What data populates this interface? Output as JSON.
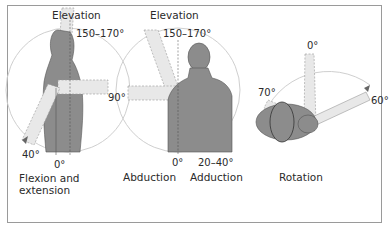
{
  "figure": {
    "panels": [
      {
        "id": "flexion-extension",
        "title": "Elevation",
        "caption_line1": "Flexion and",
        "caption_line2": "extension",
        "angles": {
          "elevation": "150–170°",
          "horizontal": "90°",
          "extension": "40°",
          "neutral": "0°"
        }
      },
      {
        "id": "abduction-adduction",
        "title": "Elevation",
        "caption_abduction": "Abduction",
        "caption_adduction": "Adduction",
        "angles": {
          "elevation": "150–170°",
          "horizontal": "90°",
          "neutral": "0°",
          "adduction": "20–40°"
        }
      },
      {
        "id": "rotation",
        "caption": "Rotation",
        "angles": {
          "neutral": "0°",
          "external": "70°",
          "internal": "60°"
        }
      }
    ],
    "colors": {
      "body_fill": "#8c8c8c",
      "limb_fill": "#e6e6e6",
      "arc_stroke": "#c8c8c8",
      "border": "#9a9a9a",
      "text": "#2a2a2a"
    }
  }
}
